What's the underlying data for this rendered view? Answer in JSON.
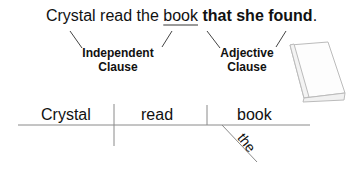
{
  "sentence": {
    "part1": "Crystal read the ",
    "underlined": "book",
    "bold": " that she found",
    "end": "."
  },
  "labels": {
    "independent_line1": "Independent",
    "independent_line2": "Clause",
    "adjective_line1": "Adjective",
    "adjective_line2": "Clause"
  },
  "diagram": {
    "subject": "Crystal",
    "verb": "read",
    "object": "book",
    "modifier": "the"
  },
  "colors": {
    "underline": "#9a9a9a",
    "lines": "#8a8a8a",
    "book_outline": "#bbbbbb"
  }
}
